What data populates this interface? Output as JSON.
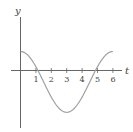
{
  "chart_data": {
    "type": "line",
    "title": "",
    "xlabel": "t",
    "ylabel": "y",
    "x_ticks": [
      "1",
      "2",
      "3",
      "4",
      "5",
      "6"
    ],
    "xlim": [
      0,
      6.4
    ],
    "grid": false,
    "legend": null,
    "series": [
      {
        "name": "y(t)",
        "description": "cosine-shaped curve, max at t=0 and t=6, min at t=3, zeros near t=1 and t=5",
        "x": [
          0,
          0.5,
          1,
          1.5,
          2,
          2.5,
          3,
          3.5,
          4,
          4.5,
          5,
          5.5,
          6
        ],
        "values": [
          1.0,
          0.82,
          0.0,
          -0.6,
          -1.3,
          -2.0,
          -2.2,
          -2.0,
          -1.3,
          -0.6,
          0.0,
          0.82,
          1.0
        ]
      }
    ],
    "colors": {
      "axis": "#555555",
      "curve": "#999999",
      "text": "#444444"
    }
  }
}
